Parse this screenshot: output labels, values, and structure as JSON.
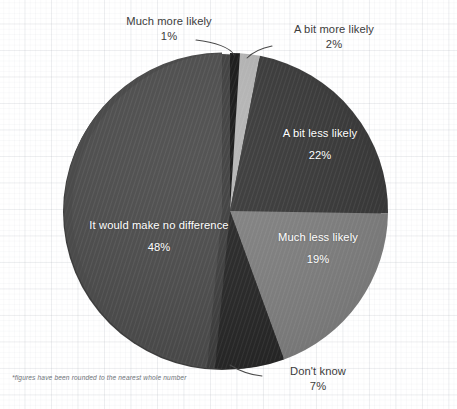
{
  "footnote": "*figures have been rounded to the nearest whole number",
  "chart_data": {
    "type": "pie",
    "title": "",
    "subtitle": "",
    "xlabel": "",
    "ylabel": "",
    "grid": true,
    "legend_position": "none",
    "units": "percent",
    "rounding_note": "*figures have been rounded to the nearest whole number",
    "labels": [
      "Much more likely",
      "A bit more likely",
      "A bit less likely",
      "Much less likely",
      "Don't know",
      "It would make no difference"
    ],
    "values": [
      1,
      2,
      22,
      19,
      7,
      48
    ],
    "value_texts": [
      "1%",
      "2%",
      "22%",
      "19%",
      "7%",
      "48%"
    ],
    "colors": [
      "#151515",
      "#b6b6b6",
      "#383838",
      "#818181",
      "#262626",
      "#4b4b4b"
    ],
    "slices": [
      {
        "label": "Much more likely",
        "value": 1,
        "value_text": "1%",
        "color": "#151515",
        "label_placement": "callout-outside",
        "exploded": false
      },
      {
        "label": "A bit more likely",
        "value": 2,
        "value_text": "2%",
        "color": "#b6b6b6",
        "label_placement": "callout-outside",
        "exploded": false
      },
      {
        "label": "A bit less likely",
        "value": 22,
        "value_text": "22%",
        "color": "#383838",
        "label_placement": "inside",
        "exploded": false
      },
      {
        "label": "Much less likely",
        "value": 19,
        "value_text": "19%",
        "color": "#818181",
        "label_placement": "inside",
        "exploded": false
      },
      {
        "label": "Don't know",
        "value": 7,
        "value_text": "7%",
        "color": "#262626",
        "label_placement": "callout-outside",
        "exploded": false
      },
      {
        "label": "It would make no difference",
        "value": 48,
        "value_text": "48%",
        "color": "#4b4b4b",
        "label_placement": "inside",
        "exploded": true
      }
    ],
    "total": 99,
    "accent_color": "#4b4b4b",
    "background_color": "#ffffff",
    "grid_color": "#e7eaef"
  }
}
